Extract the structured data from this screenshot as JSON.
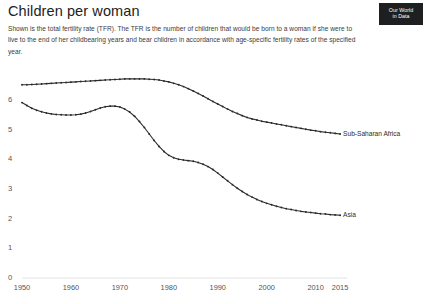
{
  "header": {
    "title": "Children per woman",
    "subtitle": "Shown is the total fertility rate (TFR). The TFR is the number of children that would be born to a woman if she were to live to the end of her childbearing years and bear children in accordance with age-specific fertility rates of the specified year."
  },
  "logo": {
    "line1": "Our World",
    "line2": "in Data",
    "bg": "#1d1f21",
    "fg": "#ffffff"
  },
  "chart_data": {
    "type": "line",
    "title": "Children per woman",
    "xlabel": "",
    "ylabel": "",
    "xlim": [
      1950,
      2016
    ],
    "ylim": [
      0,
      6.75
    ],
    "grid": false,
    "legend_position": "inline-right-end-labels",
    "marker": "dot",
    "line_color": "#2b2b2b",
    "ytick_labels": [
      "0",
      "1",
      "2",
      "3",
      "4",
      "5",
      "6"
    ],
    "yticks": [
      0,
      1,
      2,
      3,
      4,
      5,
      6
    ],
    "xtick_labels": [
      "1950",
      "1960",
      "1970",
      "1980",
      "1990",
      "2000",
      "2010",
      "2015"
    ],
    "xticks": [
      1950,
      1960,
      1970,
      1980,
      1990,
      2000,
      2010,
      2015
    ],
    "x": [
      1950,
      1951,
      1952,
      1953,
      1954,
      1955,
      1956,
      1957,
      1958,
      1959,
      1960,
      1961,
      1962,
      1963,
      1964,
      1965,
      1966,
      1967,
      1968,
      1969,
      1970,
      1971,
      1972,
      1973,
      1974,
      1975,
      1976,
      1977,
      1978,
      1979,
      1980,
      1981,
      1982,
      1983,
      1984,
      1985,
      1986,
      1987,
      1988,
      1989,
      1990,
      1991,
      1992,
      1993,
      1994,
      1995,
      1996,
      1997,
      1998,
      1999,
      2000,
      2001,
      2002,
      2003,
      2004,
      2005,
      2006,
      2007,
      2008,
      2009,
      2010,
      2011,
      2012,
      2013,
      2014,
      2015
    ],
    "series": [
      {
        "name": "Sub-Saharan Africa",
        "label": "Sub-Saharan Africa",
        "color": "#2b2b2b",
        "values": [
          6.52,
          6.52,
          6.53,
          6.54,
          6.55,
          6.56,
          6.57,
          6.58,
          6.59,
          6.6,
          6.61,
          6.62,
          6.63,
          6.64,
          6.65,
          6.66,
          6.67,
          6.68,
          6.69,
          6.7,
          6.71,
          6.72,
          6.72,
          6.72,
          6.72,
          6.72,
          6.71,
          6.7,
          6.68,
          6.65,
          6.62,
          6.57,
          6.52,
          6.46,
          6.39,
          6.31,
          6.23,
          6.14,
          6.05,
          5.96,
          5.87,
          5.79,
          5.7,
          5.62,
          5.55,
          5.48,
          5.42,
          5.37,
          5.33,
          5.29,
          5.26,
          5.23,
          5.2,
          5.17,
          5.14,
          5.11,
          5.08,
          5.05,
          5.02,
          4.99,
          4.97,
          4.94,
          4.92,
          4.9,
          4.88,
          4.86
        ]
      },
      {
        "name": "Asia",
        "label": "Asia",
        "color": "#2b2b2b",
        "values": [
          5.92,
          5.82,
          5.73,
          5.66,
          5.61,
          5.57,
          5.54,
          5.52,
          5.51,
          5.5,
          5.5,
          5.51,
          5.53,
          5.57,
          5.62,
          5.68,
          5.74,
          5.78,
          5.8,
          5.8,
          5.77,
          5.7,
          5.6,
          5.46,
          5.28,
          5.08,
          4.86,
          4.64,
          4.44,
          4.27,
          4.14,
          4.06,
          4.01,
          3.98,
          3.96,
          3.94,
          3.9,
          3.84,
          3.76,
          3.66,
          3.54,
          3.41,
          3.28,
          3.15,
          3.03,
          2.92,
          2.82,
          2.73,
          2.65,
          2.58,
          2.52,
          2.47,
          2.42,
          2.38,
          2.34,
          2.31,
          2.28,
          2.25,
          2.23,
          2.21,
          2.19,
          2.17,
          2.16,
          2.14,
          2.13,
          2.12
        ]
      }
    ]
  }
}
